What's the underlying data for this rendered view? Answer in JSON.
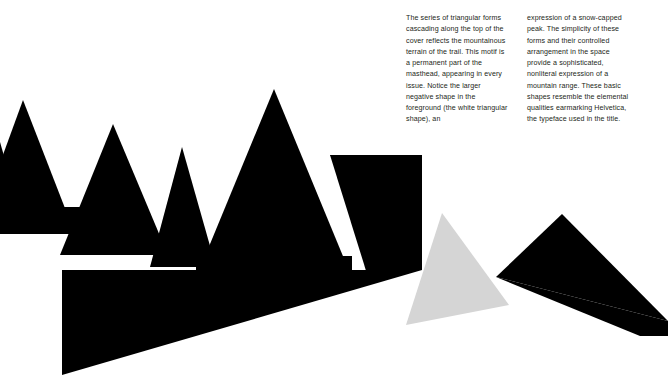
{
  "page": {
    "background_color": "#ffffff"
  },
  "rules": {
    "color": "#a9a9ad",
    "short_rule_label": "top-rule-left",
    "long_rule_label": "top-rule-right"
  },
  "caption": {
    "column_left": "The series of triangular forms cascading along the top of the cover reflects the mountainous terrain of the trail. This motif is a permanent part of the masthead, appearing in every issue. Notice the larger negative shape in the foreground (the white triangular shape), an",
    "column_right": "expression of a snow-capped peak. The simplicity of these forms and their controlled arrangement in the space provide a sophisticated, nonliteral expression of a mountain range. These basic shapes resemble the elemental qualities earmarking Helvetica, the typeface used in the title.",
    "text_color": "#231f20"
  },
  "artwork": {
    "name": "mountain-range-triangles",
    "black": "#000000",
    "gray": "#d5d5d5",
    "white": "#ffffff",
    "shapes": [
      {
        "name": "peak-far-left-clipped",
        "fill": "#000000",
        "points": "-34,233 -4,128 26,233"
      },
      {
        "name": "peak-left-tall",
        "fill": "#000000",
        "points": "-26,234 23,100 75,234"
      },
      {
        "name": "peak-left-base-slab",
        "fill": "#000000",
        "points": "-26,207 96,207 96,234 -26,234"
      },
      {
        "name": "peak-second",
        "fill": "#000000",
        "points": "60,255 113,124 168,255"
      },
      {
        "name": "peak-third-notched",
        "fill": "#000000",
        "points": "150,267 182,147 216,267"
      },
      {
        "name": "peak-main-large",
        "fill": "#000000",
        "points": "196,278 274,89 352,278"
      },
      {
        "name": "ridge-slab-upper",
        "fill": "#000000",
        "points": "196,256 352,256 352,278 196,278"
      },
      {
        "name": "ridge-right-wedge",
        "fill": "#000000",
        "points": "330,155 422,246 422,156"
      },
      {
        "name": "ridge-right-block",
        "fill": "#000000",
        "points": "330,155 422,155 422,290 372,290"
      },
      {
        "name": "foreground-black-mass",
        "fill": "#000000",
        "points": "62,270 422,270 422,290 360,375 62,375"
      },
      {
        "name": "foreground-white-negative-triangle",
        "fill": "#ffffff",
        "points": "62,375 422,270 422,375"
      },
      {
        "name": "snowcapped-gray-triangle",
        "fill": "#d5d5d5",
        "points": "442,213 406,325 509,305"
      },
      {
        "name": "peak-far-right",
        "fill": "#000000",
        "points": "496,277 562,214 668,321"
      },
      {
        "name": "peak-far-right-skirt",
        "fill": "#000000",
        "points": "496,277 668,321 668,336 640,336"
      }
    ]
  }
}
